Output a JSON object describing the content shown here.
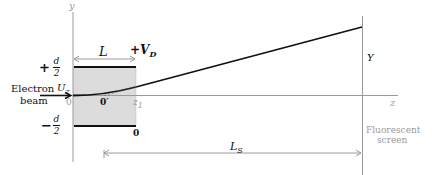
{
  "diagram": {
    "axes": {
      "y_label": "y",
      "z_label": "z"
    },
    "plates": {
      "length_label": "L",
      "voltage_label": "+V",
      "voltage_sub": "D",
      "top_label_sign": "+",
      "top_label_num": "d",
      "top_label_den": "2",
      "bottom_label_sign": "−",
      "bottom_label_num": "d",
      "bottom_label_den": "2",
      "bottom_plate_potential": "0"
    },
    "beam": {
      "label_line1": "Electron",
      "label_line2": "beam",
      "velocity_label": "U",
      "velocity_sub": "z"
    },
    "points": {
      "origin": "0",
      "midpoint": "0′",
      "exit": "z",
      "exit_sub": "1"
    },
    "screen": {
      "deflection_label": "Y",
      "distance_label": "L",
      "distance_sub": "S",
      "label_line1": "Fluorescent",
      "label_line2": "screen"
    },
    "colors": {
      "plate_fill": "#d9d9d9",
      "axis": "#9a9a9a",
      "ink": "#111111"
    }
  }
}
